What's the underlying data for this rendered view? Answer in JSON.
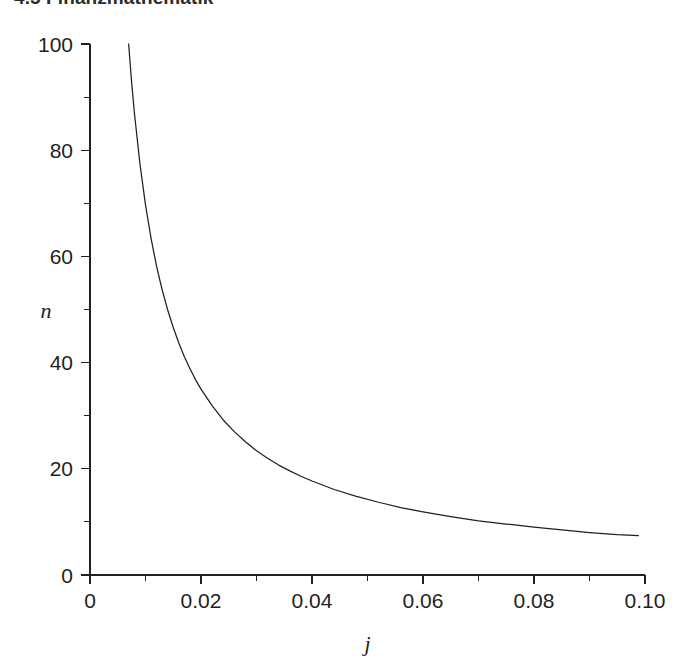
{
  "header": {
    "running_head": "4.5 Finanzmathematik"
  },
  "chart_data": {
    "type": "line",
    "title": "",
    "subtitle": "",
    "xlabel": "j",
    "ylabel": "n",
    "xlim": [
      0,
      0.1
    ],
    "ylim": [
      0,
      100
    ],
    "grid": false,
    "legend": null,
    "x_ticks": [
      0,
      0.02,
      0.04,
      0.06,
      0.08,
      0.1
    ],
    "x_tick_labels": [
      "0",
      "0.02",
      "0.04",
      "0.06",
      "0.08",
      "0.10"
    ],
    "x_minor_ticks": [
      0.01,
      0.03,
      0.05,
      0.07,
      0.09
    ],
    "y_ticks": [
      0,
      20,
      40,
      60,
      80,
      100
    ],
    "y_tick_labels": [
      "0",
      "20",
      "40",
      "60",
      "80",
      "100"
    ],
    "y_minor_ticks": [
      10,
      30,
      50,
      70,
      90
    ],
    "series": [
      {
        "name": "n = ln(2) / ln(1+j)",
        "x": [
          0.00696,
          0.0075,
          0.008,
          0.009,
          0.01,
          0.011,
          0.012,
          0.013,
          0.014,
          0.015,
          0.016,
          0.017,
          0.018,
          0.019,
          0.02,
          0.022,
          0.024,
          0.026,
          0.028,
          0.03,
          0.032,
          0.034,
          0.036,
          0.038,
          0.04,
          0.044,
          0.048,
          0.052,
          0.056,
          0.06,
          0.065,
          0.07,
          0.075,
          0.08,
          0.085,
          0.09,
          0.095,
          0.0988
        ],
        "y": [
          100.0,
          92.8,
          87.0,
          77.4,
          69.7,
          63.4,
          58.1,
          53.7,
          49.9,
          46.6,
          43.7,
          41.1,
          38.9,
          36.8,
          35.0,
          31.9,
          29.2,
          27.0,
          25.1,
          23.4,
          22.0,
          20.7,
          19.6,
          18.6,
          17.7,
          16.1,
          14.8,
          13.7,
          12.7,
          11.9,
          11.0,
          10.2,
          9.6,
          9.0,
          8.5,
          8.0,
          7.6,
          7.4
        ]
      }
    ],
    "annotations": []
  }
}
